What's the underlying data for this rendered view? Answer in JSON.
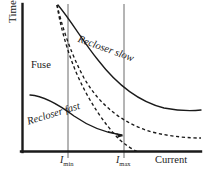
{
  "figure": {
    "name": "recloser-fuse-coordination-curves",
    "axes": {
      "y_title": "Time",
      "x_title": "Current",
      "x_ticks": [
        {
          "name": "imin",
          "text": "I",
          "sub": "min",
          "x": 68
        },
        {
          "name": "imax",
          "text": "I",
          "sub": "max",
          "x": 124
        }
      ],
      "origin": {
        "x": 22,
        "y": 152
      },
      "x_end": 201,
      "y_top": 4,
      "axis_color": "#1a1a1a",
      "gridline_color": "#6b6b6b"
    },
    "labels": {
      "fuse": "Fuse",
      "recloser_slow": "Recloser slow",
      "recloser_fast": "Recloser fast"
    },
    "curve_color": "#1a1a1a"
  },
  "chart_data": {
    "type": "line",
    "title": "",
    "xlabel": "Current",
    "ylabel": "Time",
    "grid": false,
    "legend": "none",
    "xlim": [
      22,
      201
    ],
    "ylim": [
      152,
      4
    ],
    "annotations": [
      {
        "text": "Fuse",
        "x": 31,
        "y": 60,
        "rotation": 0,
        "style": "upright"
      },
      {
        "text": "Recloser slow",
        "x": 80,
        "y": 34,
        "rotation": 20,
        "style": "italic"
      },
      {
        "text": "Recloser fast",
        "x": 26,
        "y": 117,
        "rotation": -17,
        "style": "italic"
      }
    ],
    "vlines": [
      {
        "label": "I_min",
        "x": 68
      },
      {
        "label": "I_max",
        "x": 124
      }
    ],
    "series": [
      {
        "name": "Recloser slow",
        "style": "solid",
        "path": "M 58,5 C 72,22 82,40 98,60 C 118,86 140,102 164,108 C 180,111 192,111 201,110"
      },
      {
        "name": "Recloser fast",
        "style": "solid",
        "path": "M 30,95 C 44,96 58,104 74,116 C 90,127 104,133 122,135"
      },
      {
        "name": "Fuse minimum melt",
        "style": "dashed",
        "path": "M 57,5 C 60,24 66,48 76,72 C 88,100 104,124 120,140 C 128,147 134,150 138,152"
      },
      {
        "name": "Fuse total clear",
        "style": "dashed",
        "path": "M 57,5 C 62,26 70,52 84,78 C 100,106 124,124 152,132 C 172,137 190,138 201,138"
      }
    ],
    "arrows": [
      {
        "name": "recloser-fast-arrow",
        "from": [
          108,
          131
        ],
        "to": [
          124,
          136
        ]
      }
    ]
  }
}
